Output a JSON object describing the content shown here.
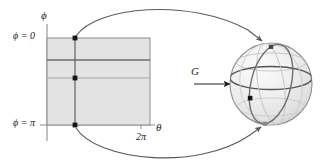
{
  "figure": {
    "labels": {
      "phi_axis": "ϕ",
      "phi_zero": "ϕ = 0",
      "phi_pi": "ϕ = π",
      "theta_max": "2π",
      "theta_axis": "θ",
      "map_name": "G"
    },
    "colors": {
      "rect_fill": "#e3e3e3",
      "rect_stroke": "#8c8c8c",
      "dark_line": "#6b6b6b",
      "light_line": "#a8a8a8",
      "point_fill": "#141414",
      "arrow_stroke": "#5a5a5a",
      "sphere_fill": "#ececec",
      "sphere_outline": "#8f8f8f",
      "equator": "#555555",
      "meridian": "#6f6f6f",
      "grid_faint": "#c3c3c3",
      "text": "#1a1a1a",
      "background": "#ffffff"
    },
    "domain_rect": {
      "name": "parameter-domain",
      "x": 47,
      "y": 38,
      "width": 103,
      "height": 87,
      "theta_range": [
        0,
        6.283185
      ],
      "phi_range": [
        0,
        3.141593
      ]
    },
    "horizontal_lines": [
      {
        "name": "latitude-line-dark",
        "phi": 0.8,
        "y": 60,
        "shade": "dark"
      },
      {
        "name": "latitude-line-light",
        "phi": 1.5708,
        "y": 78,
        "shade": "light"
      }
    ],
    "vertical_line": {
      "name": "meridian-line",
      "theta": 1.7,
      "x": 75
    },
    "rect_points": [
      {
        "name": "point-top",
        "x": 75,
        "y": 38,
        "meaning": "ϕ = 0 (north pole preimage)"
      },
      {
        "name": "point-middle",
        "x": 75,
        "y": 78,
        "meaning": "interior point"
      },
      {
        "name": "point-bottom",
        "x": 75,
        "y": 125,
        "meaning": "ϕ = π (south pole preimage)"
      }
    ],
    "sphere": {
      "name": "target-sphere",
      "cx": 271,
      "cy": 84,
      "r": 41,
      "points": [
        {
          "name": "sphere-point-north",
          "x": 271,
          "y": 47,
          "meaning": "north pole"
        },
        {
          "name": "sphere-point-interior",
          "x": 250,
          "y": 98,
          "meaning": "image of interior point"
        },
        {
          "name": "sphere-point-south",
          "x": 265,
          "y": 124,
          "meaning": "south pole"
        }
      ]
    },
    "arrows": [
      {
        "name": "arrow-top-collapse",
        "from": "point-top",
        "to": "sphere-point-north"
      },
      {
        "name": "arrow-bottom-collapse",
        "from": "point-bottom",
        "to": "sphere-point-south"
      },
      {
        "name": "arrow-map-G",
        "label": "G",
        "from": [
          194,
          84
        ],
        "to": [
          232,
          84
        ]
      }
    ]
  }
}
